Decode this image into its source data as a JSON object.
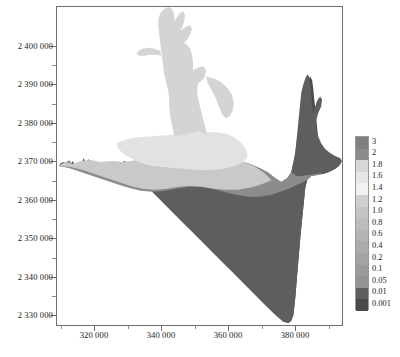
{
  "figure": {
    "type": "contour-map",
    "title": "",
    "caption": ""
  },
  "chart_data": {
    "type": "heatmap",
    "title": "",
    "xlabel": "",
    "ylabel": "",
    "xlim": [
      313000,
      392000
    ],
    "ylim": [
      2326000,
      2404000
    ],
    "grid": false,
    "legend_position": "right",
    "x_ticks": [
      "320 000",
      "340 000",
      "360 000",
      "380 000"
    ],
    "x_tick_values": [
      320000,
      340000,
      360000,
      380000
    ],
    "y_ticks": [
      "2 400 000",
      "2 390 000",
      "2 380 000",
      "2 370 000",
      "2 360 000",
      "2 350 000",
      "2 340 000",
      "2 330 000"
    ],
    "y_tick_values": [
      2400000,
      2390000,
      2380000,
      2370000,
      2360000,
      2350000,
      2340000,
      2330000
    ],
    "colorbar": {
      "labels": [
        "3",
        "2",
        "1.8",
        "1.6",
        "1.4",
        "1.2",
        "1.0",
        "0.8",
        "0.6",
        "0.4",
        "0.2",
        "0.1",
        "0.05",
        "0.01",
        "0.001"
      ],
      "values": [
        3,
        2,
        1.8,
        1.6,
        1.4,
        1.2,
        1.0,
        0.8,
        0.6,
        0.4,
        0.2,
        0.1,
        0.05,
        0.01,
        0.001
      ],
      "colors": [
        "#808080",
        "#8c8c8c",
        "#d7d7d7",
        "#e7e7e7",
        "#f2f2f2",
        "#cfcfcf",
        "#c4c4c4",
        "#bcbcbc",
        "#b4b4b4",
        "#ababab",
        "#a3a3a3",
        "#9b9b9b",
        "#949494",
        "#5e5e5e",
        "#4a4a4a"
      ]
    },
    "regions": [
      {
        "name": "deep-basin",
        "level": "0.001",
        "color": "#4a4a4a"
      },
      {
        "name": "mid-shelf",
        "level": "0.01",
        "color": "#5e5e5e"
      },
      {
        "name": "inner-band",
        "level": "0.05",
        "color": "#8c8c8c"
      },
      {
        "name": "nearshore-band",
        "level": "1.2",
        "color": "#c9c9c9"
      },
      {
        "name": "core-plume",
        "level": "1.6",
        "color": "#e2e2e2"
      },
      {
        "name": "estuary-channel",
        "level": "1.8",
        "color": "#d4d4d4"
      }
    ]
  },
  "axes": {
    "frame_color": "#6e6e6e",
    "background": "#ffffff"
  }
}
